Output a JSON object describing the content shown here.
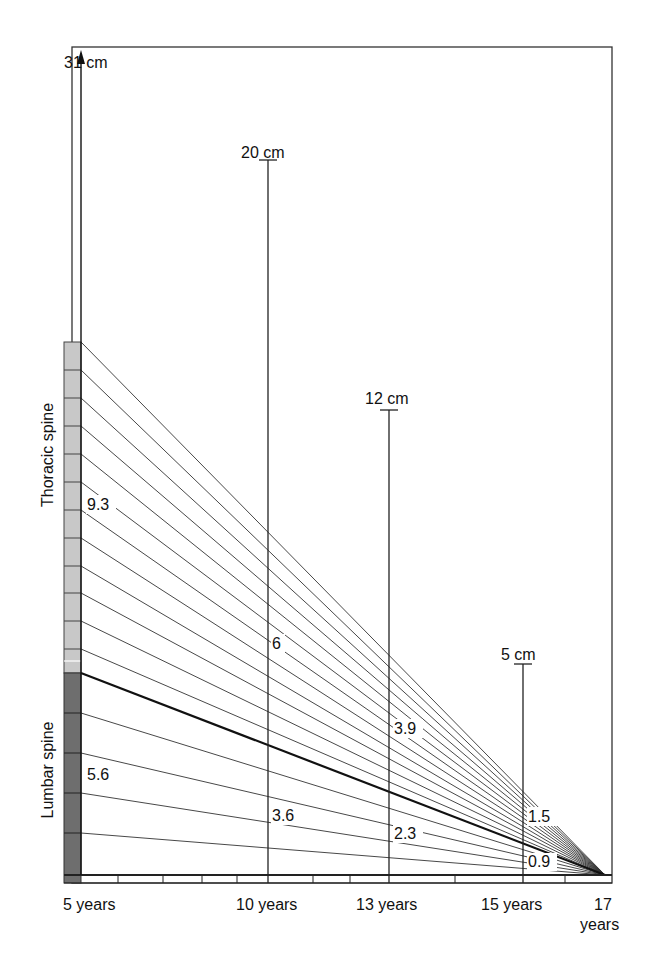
{
  "diagram": {
    "spine_regions": [
      {
        "name": "Thoracic spine",
        "segments": 12,
        "color": "#c8c8c8"
      },
      {
        "name": "Lumbar spine",
        "segments": 5,
        "color": "#6e6e6e"
      }
    ],
    "heights": [
      {
        "age": "5 years",
        "label": "31 cm"
      },
      {
        "age": "10 years",
        "label": "20 cm"
      },
      {
        "age": "13 years",
        "label": "12 cm"
      },
      {
        "age": "15 years",
        "label": "5 cm"
      }
    ],
    "value_labels": {
      "thoracic": [
        {
          "age": "5 years",
          "value": "9.3"
        },
        {
          "age": "10 years",
          "value": "6"
        },
        {
          "age": "13 years",
          "value": "3.9"
        },
        {
          "age": "15 years",
          "value": "1.5"
        }
      ],
      "lumbar": [
        {
          "age": "5 years",
          "value": "5.6"
        },
        {
          "age": "10 years",
          "value": "3.6"
        },
        {
          "age": "13 years",
          "value": "2.3"
        },
        {
          "age": "15 years",
          "value": "0.9"
        }
      ]
    },
    "x_axis": {
      "labels": [
        "5 years",
        "10 years",
        "13 years",
        "15 years",
        "17",
        "years"
      ]
    },
    "colors": {
      "line": "#222222",
      "thoracic_fill": "#c8c8c8",
      "lumbar_fill": "#6e6e6e",
      "frame": "#333333"
    }
  }
}
